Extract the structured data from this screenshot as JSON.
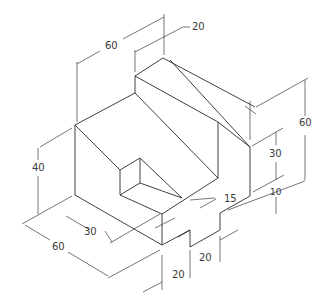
{
  "drawing": {
    "type": "isometric technical drawing",
    "line_color": "#2a2a2a",
    "dimensions": [
      {
        "id": "top-width",
        "value": "60"
      },
      {
        "id": "ridge-width",
        "value": "20"
      },
      {
        "id": "overall-height",
        "value": "60"
      },
      {
        "id": "step-height",
        "value": "30"
      },
      {
        "id": "base-height",
        "value": "10"
      },
      {
        "id": "left-height",
        "value": "40"
      },
      {
        "id": "depth",
        "value": "60"
      },
      {
        "id": "slot-length",
        "value": "30"
      },
      {
        "id": "chamfer",
        "value": "15"
      },
      {
        "id": "notch-width",
        "value": "20"
      },
      {
        "id": "notch-depth",
        "value": "20"
      }
    ]
  }
}
